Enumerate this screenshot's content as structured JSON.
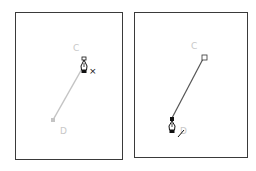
{
  "panels": [
    {
      "id": "left",
      "labels": {
        "start": "C",
        "end": "D"
      },
      "cursor_modifier": "×",
      "line_color": "#c4c4c4",
      "description": "pen tool with delete-anchor modifier over point C"
    },
    {
      "id": "right",
      "labels": {
        "start": "C",
        "end": "D"
      },
      "cursor_modifier": "/",
      "line_color": "#555555",
      "description": "pen tool continuing path near point D"
    }
  ],
  "colors": {
    "border": "#3a3a3a",
    "label": "#c8c8c8",
    "cursor": "#111111"
  }
}
